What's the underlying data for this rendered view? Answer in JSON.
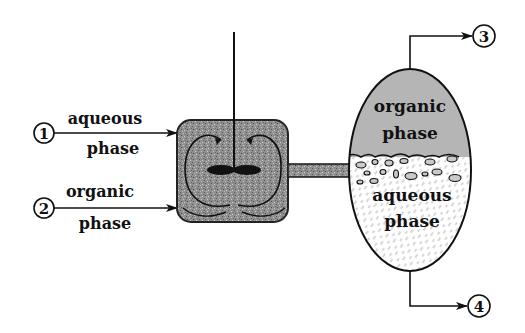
{
  "diagram": {
    "type": "mixer-settler",
    "streams": [
      {
        "number": "1",
        "label_line1": "aqueous",
        "label_line2": "phase",
        "direction": "in"
      },
      {
        "number": "2",
        "label_line1": "organic",
        "label_line2": "phase",
        "direction": "in"
      },
      {
        "number": "3",
        "direction": "out"
      },
      {
        "number": "4",
        "direction": "out"
      }
    ],
    "settler": {
      "upper_label_line1": "organic",
      "upper_label_line2": "phase",
      "lower_label_line1": "aqueous",
      "lower_label_line2": "phase"
    },
    "colors": {
      "line": "#111111",
      "mixer_fill": "#8c8c8c",
      "organic_fill": "#b4b4b4",
      "aqueous_fill": "#ffffff"
    }
  }
}
